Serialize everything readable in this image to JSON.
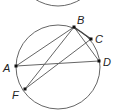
{
  "diagram": {
    "type": "circle-geometry",
    "stroke_color": "#666666",
    "point_color": "#111111",
    "top_arc": {
      "cx": 58,
      "cy": -20,
      "r": 27
    },
    "circle": {
      "cx": 58,
      "cy": 67,
      "r": 42
    },
    "points": [
      {
        "name": "A",
        "x": 16,
        "y": 66,
        "label": "A",
        "lx": 3,
        "ly": 72
      },
      {
        "name": "B",
        "x": 74,
        "y": 27,
        "label": "B",
        "lx": 77,
        "ly": 24
      },
      {
        "name": "C",
        "x": 91,
        "y": 39,
        "label": "C",
        "lx": 96,
        "ly": 42
      },
      {
        "name": "D",
        "x": 99,
        "y": 61,
        "label": "D",
        "lx": 103,
        "ly": 65
      },
      {
        "name": "F",
        "x": 25,
        "y": 89,
        "label": "F",
        "lx": 12,
        "ly": 98
      }
    ],
    "segments": [
      [
        "A",
        "B"
      ],
      [
        "A",
        "D"
      ],
      [
        "B",
        "F"
      ],
      [
        "B",
        "D"
      ],
      [
        "B",
        "C"
      ],
      [
        "F",
        "C"
      ]
    ]
  }
}
